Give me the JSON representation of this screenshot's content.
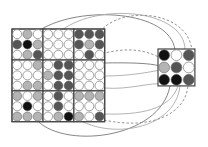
{
  "colors": {
    "W": "#ffffff",
    "G": "#b4b4b4",
    "D": "#555555",
    "B": "#111111",
    "stroke": "#555555",
    "grid": "#444444",
    "curve_solid": "#777777",
    "curve_light": "#aaaaaa",
    "curve_dashed": "#888888"
  },
  "large_grid": {
    "x": 12,
    "y": 29,
    "cell": 10.3,
    "blocks": [
      [
        [
          [
            "W",
            "G",
            "W"
          ],
          [
            "D",
            "B",
            "G"
          ],
          [
            "W",
            "G",
            "D"
          ]
        ],
        [
          [
            "W",
            "W",
            "W"
          ],
          [
            "W",
            "W",
            "W"
          ],
          [
            "W",
            "W",
            "W"
          ]
        ],
        [
          [
            "D",
            "D",
            "D"
          ],
          [
            "D",
            "G",
            "D"
          ],
          [
            "W",
            "D",
            "W"
          ]
        ]
      ],
      [
        [
          [
            "W",
            "W",
            "G"
          ],
          [
            "W",
            "W",
            "W"
          ],
          [
            "W",
            "G",
            "G"
          ]
        ],
        [
          [
            "W",
            "D",
            "D"
          ],
          [
            "G",
            "D",
            "D"
          ],
          [
            "W",
            "D",
            "D"
          ]
        ],
        [
          [
            "W",
            "W",
            "W"
          ],
          [
            "W",
            "W",
            "W"
          ],
          [
            "W",
            "W",
            "W"
          ]
        ]
      ],
      [
        [
          [
            "G",
            "W",
            "G"
          ],
          [
            "W",
            "B",
            "W"
          ],
          [
            "G",
            "G",
            "G"
          ]
        ],
        [
          [
            "W",
            "D",
            "W"
          ],
          [
            "W",
            "D",
            "W"
          ],
          [
            "W",
            "G",
            "B"
          ]
        ],
        [
          [
            "G",
            "G",
            "G"
          ],
          [
            "W",
            "W",
            "W"
          ],
          [
            "G",
            "W",
            "D"
          ]
        ]
      ]
    ]
  },
  "small_grid": {
    "x": 158,
    "y": 49,
    "cell": 12.3,
    "cells": [
      [
        "B",
        "W",
        "D"
      ],
      [
        "G",
        "D",
        "W"
      ],
      [
        "B",
        "B",
        "D"
      ]
    ]
  },
  "connections": [
    {
      "type": "solid",
      "d": "M40 30 C 80 5, 170 10, 175 50"
    },
    {
      "type": "light",
      "d": "M62 30 C 100 2, 185 10, 185 50"
    },
    {
      "type": "dashed",
      "d": "M100 32 C 120 5, 190 10, 192 52"
    },
    {
      "type": "dashed",
      "d": "M98 55 C 130 45, 150 52, 160 58"
    },
    {
      "type": "solid",
      "d": "M38 66 C 70 64, 140 60, 160 66"
    },
    {
      "type": "light",
      "d": "M104 76 C 130 76, 150 72, 160 70"
    },
    {
      "type": "light",
      "d": "M104 88 C 130 90, 150 82, 164 84"
    },
    {
      "type": "solid",
      "d": "M35 118 C 60 150, 160 140, 170 86"
    },
    {
      "type": "light",
      "d": "M76 118 C 110 140, 175 130, 180 86"
    },
    {
      "type": "dashed",
      "d": "M104 120 C 150 130, 185 115, 188 86"
    },
    {
      "type": "light",
      "d": "M104 114 C 140 115, 170 110, 178 86"
    }
  ]
}
